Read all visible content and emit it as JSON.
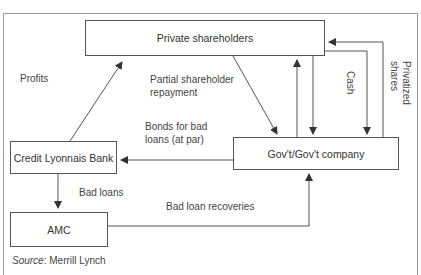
{
  "diagram": {
    "nodes": {
      "private_shareholders": "Private shareholders",
      "credit_lyonnais": "Credit Lyonnais Bank",
      "amc": "AMC",
      "government": "Gov't/Gov't company"
    },
    "edge_labels": {
      "profits": "Profits",
      "partial_repayment_line1": "Partial shareholder",
      "partial_repayment_line2": "repayment",
      "bonds_line1": "Bonds for bad",
      "bonds_line2": "loans (at par)",
      "bad_loans": "Bad loans",
      "bad_loan_recoveries": "Bad loan recoveries",
      "cash": "Cash",
      "privatized_line1": "Privatized",
      "privatized_line2": "shares"
    },
    "edges": [
      {
        "from": "Credit Lyonnais Bank",
        "to": "Private shareholders",
        "label": "Profits"
      },
      {
        "from": "Private shareholders",
        "to": "Gov't/Gov't company",
        "label": "Partial shareholder repayment"
      },
      {
        "from": "Gov't/Gov't company",
        "to": "Credit Lyonnais Bank",
        "label": "Bonds for bad loans (at par)"
      },
      {
        "from": "Credit Lyonnais Bank",
        "to": "AMC",
        "label": "Bad loans"
      },
      {
        "from": "AMC",
        "to": "Gov't/Gov't company",
        "label": "Bad loan recoveries"
      },
      {
        "from": "Gov't/Gov't company",
        "to": "Private shareholders",
        "label": ""
      },
      {
        "from": "Private shareholders",
        "to": "Gov't/Gov't company",
        "label": "Cash"
      },
      {
        "from": "Gov't/Gov't company",
        "to": "Private shareholders",
        "label": "Privatized shares"
      }
    ],
    "source_prefix": "Source",
    "source_suffix": ": Merrill Lynch"
  }
}
